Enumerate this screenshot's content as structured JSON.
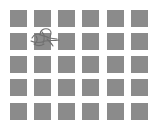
{
  "grid": {
    "rows": 5,
    "cols": 6,
    "tile_color": "#8b8b8b",
    "background_color": "#ffffff",
    "marked_tile": {
      "row": 1,
      "col": 1,
      "icon": "sketch-object-icon"
    }
  }
}
